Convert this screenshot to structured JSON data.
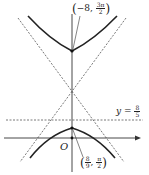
{
  "diagram": {
    "type": "hyperbola-graph",
    "colors": {
      "curve": "#222222",
      "axis": "#333333",
      "dashed": "#555555",
      "background": "#ffffff"
    },
    "origin_label": "O",
    "horizontal_line": {
      "label_var": "y",
      "label_eq": "=",
      "num": "8",
      "den": "5"
    },
    "point_top": {
      "x_sign": "−8",
      "sep": ",",
      "num": "3π",
      "den": "2"
    },
    "point_bottom": {
      "x_num": "8",
      "x_den": "9",
      "sep": ",",
      "num": "π",
      "den": "2"
    },
    "elements": [
      "upper-hyperbola-branch",
      "lower-hyperbola-branch",
      "asymptote-1",
      "asymptote-2",
      "horizontal-dashed-line",
      "x-axis",
      "y-axis"
    ]
  }
}
